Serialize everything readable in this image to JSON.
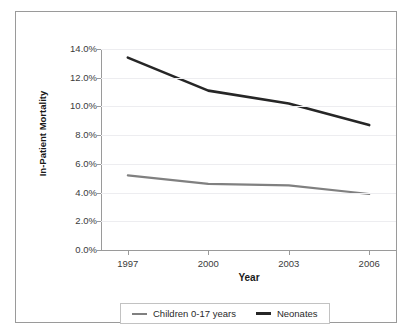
{
  "top_clipped_text": "",
  "axis": {
    "y_title": "In-Patient Mortality",
    "x_title": "Year"
  },
  "legend": {
    "entries": [
      {
        "label": "Children 0-17 years",
        "color": "#808080"
      },
      {
        "label": "Neonates",
        "color": "#262626"
      }
    ]
  },
  "colors": {
    "neonates": "#262626",
    "children": "#808080",
    "grid": "#ededf0",
    "axis": "#9a9a9a",
    "frame": "#9a9a9a",
    "background": "#ffffff"
  },
  "chart_data": {
    "type": "line",
    "title": "",
    "xlabel": "Year",
    "ylabel": "In-Patient Mortality",
    "x": [
      1997,
      2000,
      2003,
      2006
    ],
    "xtick_labels": [
      "1997",
      "2000",
      "2003",
      "2006"
    ],
    "ytick_labels": [
      "0.0%",
      "2.0%",
      "4.0%",
      "6.0%",
      "8.0%",
      "10.0%",
      "12.0%",
      "14.0%"
    ],
    "ytick_values": [
      0,
      2,
      4,
      6,
      8,
      10,
      12,
      14
    ],
    "ylim": [
      0,
      14
    ],
    "xlim": [
      1996,
      2007
    ],
    "grid": true,
    "legend_position": "bottom",
    "series": [
      {
        "name": "Children 0-17 years",
        "color": "#808080",
        "values": [
          5.2,
          4.6,
          4.5,
          3.9
        ]
      },
      {
        "name": "Neonates",
        "color": "#262626",
        "values": [
          13.4,
          11.1,
          10.2,
          8.7
        ]
      }
    ]
  }
}
